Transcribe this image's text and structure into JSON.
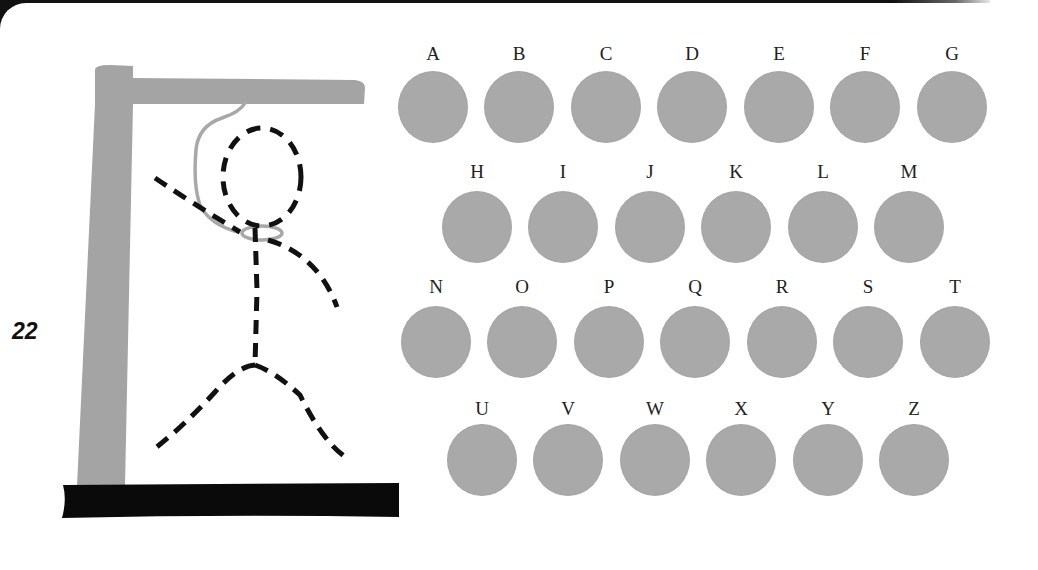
{
  "game": {
    "score": "22",
    "colors": {
      "gallows": "#a4a4a4",
      "base": "#0a0a0a",
      "figure": "#111111",
      "rope": "#a8a8a8",
      "letter_disc": "#a9a9a9",
      "letter_text": "#222222"
    }
  },
  "hangman": {
    "parts": [
      "gallows-post",
      "gallows-beam",
      "gallows-base",
      "rope",
      "head",
      "body",
      "left-arm",
      "right-arm",
      "left-leg",
      "right-leg"
    ]
  },
  "keyboard": {
    "rows": [
      {
        "letters": [
          "A",
          "B",
          "C",
          "D",
          "E",
          "F",
          "G"
        ],
        "centers_x": [
          433,
          519,
          606,
          692,
          779,
          865,
          952
        ],
        "label_y": 43,
        "disc_y": 71
      },
      {
        "letters": [
          "H",
          "I",
          "J",
          "K",
          "L",
          "M"
        ],
        "centers_x": [
          477,
          563,
          650,
          736,
          823,
          909
        ],
        "label_y": 161,
        "disc_y": 191
      },
      {
        "letters": [
          "N",
          "O",
          "P",
          "Q",
          "R",
          "S",
          "T"
        ],
        "centers_x": [
          436,
          522,
          609,
          695,
          782,
          868,
          955
        ],
        "label_y": 276,
        "disc_y": 306
      },
      {
        "letters": [
          "U",
          "V",
          "W",
          "X",
          "Y",
          "Z"
        ],
        "centers_x": [
          482,
          568,
          655,
          741,
          828,
          914
        ],
        "label_y": 398,
        "disc_y": 424
      }
    ]
  }
}
